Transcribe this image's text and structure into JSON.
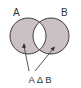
{
  "diagram": {
    "type": "venn",
    "set_labels": {
      "a": "A",
      "b": "B"
    },
    "operation_label": "A Δ B",
    "operation_parts": [
      "A",
      "Δ",
      "B"
    ],
    "colors": {
      "fill": "#cbc1c2",
      "stroke": "#2b2b2b",
      "intersection": "#ffffff",
      "text": "#333333"
    },
    "shaded_regions": [
      "A only",
      "B only"
    ],
    "unshaded_regions": [
      "A ∩ B"
    ]
  }
}
